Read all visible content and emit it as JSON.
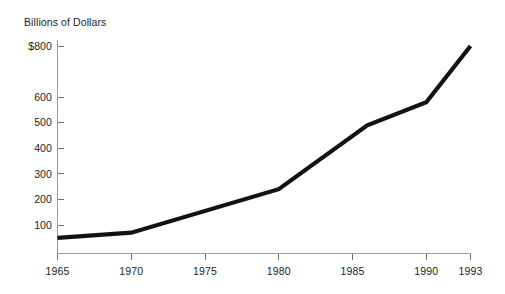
{
  "chart_data": {
    "type": "line",
    "title": "Billions of Dollars",
    "xlabel": "",
    "ylabel": "Billions of Dollars",
    "grid": false,
    "legend": "none",
    "line_color": "#121212",
    "axis_color": "#9a9a9a",
    "text_color": "#1d1d1d",
    "xlim": [
      1965,
      1993
    ],
    "ylim": [
      0,
      840
    ],
    "x_tick_labels": [
      "1965",
      "1970",
      "1975",
      "1980",
      "1985",
      "1990",
      "1993"
    ],
    "x_ticks": [
      1965,
      1970,
      1975,
      1980,
      1985,
      1990,
      1993
    ],
    "y_tick_labels": [
      "$800",
      "600",
      "500",
      "400",
      "300",
      "200",
      "100"
    ],
    "y_ticks": [
      800,
      600,
      500,
      400,
      300,
      200,
      100
    ],
    "x": [
      1965,
      1970,
      1980,
      1986,
      1990,
      1993
    ],
    "values": [
      50,
      70,
      240,
      490,
      580,
      800
    ],
    "points": [
      {
        "x": 1965,
        "y": 50
      },
      {
        "x": 1970,
        "y": 70
      },
      {
        "x": 1980,
        "y": 240
      },
      {
        "x": 1986,
        "y": 490
      },
      {
        "x": 1990,
        "y": 580
      },
      {
        "x": 1993,
        "y": 800
      }
    ]
  },
  "axis": {
    "y_title": "Billions of Dollars"
  }
}
